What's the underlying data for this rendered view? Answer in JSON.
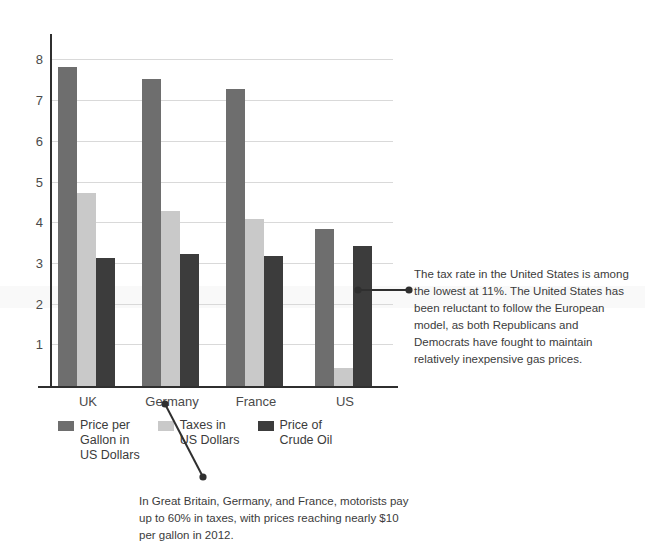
{
  "chart_data": {
    "type": "bar",
    "title": "",
    "subtitle": "",
    "xlabel": "",
    "ylabel": "",
    "grid": true,
    "legend_position": "bottom",
    "ylim": [
      0,
      8.5
    ],
    "yticks": [
      1,
      2,
      3,
      4,
      5,
      6,
      7,
      8
    ],
    "ytick_labels": [
      "1",
      "2",
      "3",
      "4",
      "5",
      "6",
      "7",
      "8"
    ],
    "categories": [
      "UK",
      "Germany",
      "France",
      "US"
    ],
    "series": [
      {
        "name": "Price per Gallon in US Dollars",
        "legend_label": "Price per\nGallon in\nUS Dollars",
        "color": "#6e6e6e",
        "values": [
          7.85,
          7.55,
          7.3,
          3.85
        ]
      },
      {
        "name": "Taxes in US Dollars",
        "legend_label": "Taxes in\nUS Dollars",
        "color": "#c9c9c9",
        "values": [
          4.75,
          4.3,
          4.1,
          0.45
        ]
      },
      {
        "name": "Price of Crude Oil",
        "legend_label": "Price of\nCrude Oil",
        "color": "#3c3c3c",
        "values": [
          3.15,
          3.25,
          3.2,
          3.45
        ]
      }
    ],
    "annotations": [
      {
        "id": "us-tax-rate-note",
        "text": "The tax rate in the United States is among the lowest at 11%. The United States has been reluctant to follow the European model, as both Republicans and Democrats have fought to maintain relatively inexpensive gas prices.",
        "points_to": "US"
      },
      {
        "id": "europe-tax-note",
        "text": "In Great Britain, Germany, and France, motorists pay up to 60% in taxes, with prices reaching nearly $10 per gallon in 2012.",
        "points_to": "Germany"
      }
    ]
  },
  "axis": {
    "tick_labels": [
      "8",
      "7",
      "6",
      "5",
      "4",
      "3",
      "2",
      "1"
    ]
  },
  "categories": {
    "uk": "UK",
    "germany": "Germany",
    "france": "France",
    "us": "US"
  },
  "legend": {
    "items": [
      {
        "label": "Price per\nGallon in\nUS Dollars"
      },
      {
        "label": "Taxes in\nUS Dollars"
      },
      {
        "label": "Price of\nCrude Oil"
      }
    ]
  },
  "annotations": {
    "right": "The tax rate in the United States is among the lowest at 11%. The United States has been reluctant to follow the European model, as both Republicans and Democrats have fought to maintain relatively inexpensive gas prices.",
    "bottom": "In Great Britain, Germany, and France, motorists pay up to 60% in taxes, with prices reaching nearly $10 per gallon in 2012."
  },
  "colors": {
    "series_price_per_gallon": "#6e6e6e",
    "series_taxes": "#c9c9c9",
    "series_crude_oil": "#3c3c3c",
    "axis": "#2f2f2f",
    "gridline": "#d9d9d9",
    "text": "#3b3b3b"
  }
}
